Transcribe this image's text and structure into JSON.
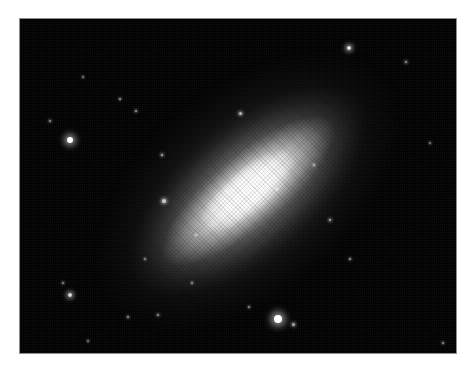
{
  "figure": {
    "kind": "astronomical-photograph",
    "medium": "grayscale photographic plate reproduction",
    "page_background": "#ffffff",
    "sky_background": "#000000",
    "plate_edge_color": "#8d8d8d",
    "caption": "",
    "title": "",
    "labels": [],
    "frame": {
      "x": 20,
      "y": 19,
      "width": 436,
      "height": 334
    }
  },
  "chart_data": {
    "type": "heatmap",
    "title": "",
    "subtitle": "",
    "xlabel": "",
    "ylabel": "",
    "tick_labels": [],
    "legend": [],
    "grid": false,
    "colormap": "grayscale",
    "value_range": [
      0,
      255
    ],
    "axis_ranges": {
      "x": [
        0,
        436
      ],
      "y": [
        0,
        334
      ]
    },
    "object": {
      "name": "",
      "morphology": "edge-on lenticular galaxy",
      "center_x": 228,
      "center_y": 172,
      "position_angle_deg": -40,
      "major_axis_px": 360,
      "minor_axis_px": 210,
      "peak_brightness": 255,
      "isophotes": [
        {
          "label": "core",
          "semi_major": 23,
          "semi_minor": 13,
          "brightness": 255
        },
        {
          "label": "bulge",
          "semi_major": 60,
          "semi_minor": 23,
          "brightness": 250
        },
        {
          "label": "inner-disk",
          "semi_major": 109,
          "semi_minor": 36,
          "brightness": 215
        },
        {
          "label": "mid-halo",
          "semi_major": 145,
          "semi_minor": 66,
          "brightness": 130
        },
        {
          "label": "outer-halo",
          "semi_major": 180,
          "semi_minor": 105,
          "brightness": 55
        }
      ]
    },
    "stars": [
      {
        "id": "star-01",
        "x": 30,
        "y": 102,
        "r": 1.3,
        "brightness": 150
      },
      {
        "id": "star-02",
        "x": 50,
        "y": 121,
        "r": 3.4,
        "brightness": 255
      },
      {
        "id": "star-03",
        "x": 329,
        "y": 29,
        "r": 2.2,
        "brightness": 230
      },
      {
        "id": "star-04",
        "x": 386,
        "y": 43,
        "r": 1.4,
        "brightness": 150
      },
      {
        "id": "star-05",
        "x": 447,
        "y": 164,
        "r": 2.6,
        "brightness": 245
      },
      {
        "id": "star-06",
        "x": 410,
        "y": 124,
        "r": 1.1,
        "brightness": 120
      },
      {
        "id": "star-07",
        "x": 258,
        "y": 300,
        "r": 4.0,
        "brightness": 255
      },
      {
        "id": "star-08",
        "x": 273,
        "y": 305,
        "r": 1.5,
        "brightness": 170
      },
      {
        "id": "star-09",
        "x": 43,
        "y": 264,
        "r": 1.2,
        "brightness": 135
      },
      {
        "id": "star-10",
        "x": 50,
        "y": 276,
        "r": 2.2,
        "brightness": 220
      },
      {
        "id": "star-11",
        "x": 108,
        "y": 298,
        "r": 1.3,
        "brightness": 150
      },
      {
        "id": "star-12",
        "x": 138,
        "y": 296,
        "r": 1.3,
        "brightness": 150
      },
      {
        "id": "star-13",
        "x": 220,
        "y": 94,
        "r": 1.5,
        "brightness": 185
      },
      {
        "id": "star-14",
        "x": 142,
        "y": 136,
        "r": 1.4,
        "brightness": 175
      },
      {
        "id": "star-15",
        "x": 144,
        "y": 182,
        "r": 1.6,
        "brightness": 190
      },
      {
        "id": "star-16",
        "x": 206,
        "y": 172,
        "r": 1.2,
        "brightness": 160
      },
      {
        "id": "star-17",
        "x": 257,
        "y": 170,
        "r": 1.1,
        "brightness": 150
      },
      {
        "id": "star-18",
        "x": 294,
        "y": 146,
        "r": 1.2,
        "brightness": 160
      },
      {
        "id": "star-19",
        "x": 310,
        "y": 201,
        "r": 1.4,
        "brightness": 175
      },
      {
        "id": "star-20",
        "x": 330,
        "y": 240,
        "r": 1.2,
        "brightness": 155
      },
      {
        "id": "star-21",
        "x": 100,
        "y": 80,
        "r": 1.2,
        "brightness": 150
      },
      {
        "id": "star-22",
        "x": 116,
        "y": 92,
        "r": 1.3,
        "brightness": 160
      },
      {
        "id": "star-23",
        "x": 176,
        "y": 216,
        "r": 1.1,
        "brightness": 145
      },
      {
        "id": "star-24",
        "x": 172,
        "y": 264,
        "r": 1.1,
        "brightness": 140
      },
      {
        "id": "star-25",
        "x": 229,
        "y": 288,
        "r": 1.1,
        "brightness": 140
      },
      {
        "id": "star-26",
        "x": 125,
        "y": 240,
        "r": 1.0,
        "brightness": 130
      },
      {
        "id": "star-27",
        "x": 63,
        "y": 58,
        "r": 1.0,
        "brightness": 125
      },
      {
        "id": "star-28",
        "x": 314,
        "y": 340,
        "r": 1.3,
        "brightness": 160
      },
      {
        "id": "star-29",
        "x": 423,
        "y": 324,
        "r": 1.1,
        "brightness": 140
      },
      {
        "id": "star-30",
        "x": 68,
        "y": 322,
        "r": 1.0,
        "brightness": 125
      }
    ]
  }
}
